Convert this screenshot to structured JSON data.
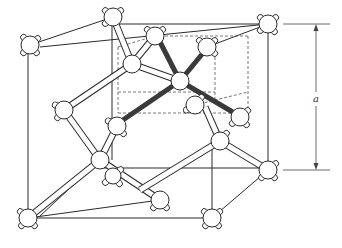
{
  "figure": {
    "dimension_label": "a",
    "colors": {
      "line": "#2a2a2a",
      "tetrahedral_bond": "#3a3a3a",
      "atom_fill": "#ffffff",
      "background": "#ffffff"
    },
    "atoms": [
      {
        "id": "corner-back-top-left",
        "x": 30,
        "y": 45
      },
      {
        "id": "corner-back-top-right",
        "x": 268,
        "y": 24
      },
      {
        "id": "face-top",
        "x": 113,
        "y": 17
      },
      {
        "id": "corner-front-bottom-left",
        "x": 28,
        "y": 218
      },
      {
        "id": "corner-front-bottom-right",
        "x": 212,
        "y": 218
      },
      {
        "id": "face-right",
        "x": 268,
        "y": 170
      },
      {
        "id": "upper-center-left",
        "x": 132,
        "y": 64
      },
      {
        "id": "upper-back-a",
        "x": 155,
        "y": 36
      },
      {
        "id": "upper-back-b",
        "x": 207,
        "y": 47
      },
      {
        "id": "tetra-center",
        "x": 180,
        "y": 81
      },
      {
        "id": "tetra-right",
        "x": 240,
        "y": 117
      },
      {
        "id": "tetra-left",
        "x": 117,
        "y": 126
      },
      {
        "id": "mid-right",
        "x": 220,
        "y": 141
      },
      {
        "id": "lower-center",
        "x": 100,
        "y": 160
      },
      {
        "id": "lower-center-b",
        "x": 113,
        "y": 176
      },
      {
        "id": "lower-middle",
        "x": 160,
        "y": 200
      },
      {
        "id": "tetra-back",
        "x": 195,
        "y": 105
      },
      {
        "id": "left-upper",
        "x": 64,
        "y": 110
      }
    ]
  }
}
